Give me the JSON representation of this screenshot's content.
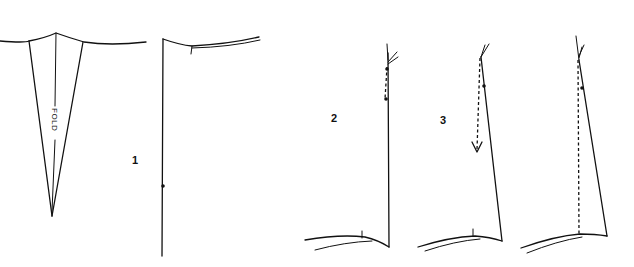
{
  "diagram": {
    "type": "sewing-pattern-steps",
    "background": "#ffffff",
    "ink_color": "#111111",
    "panels": [
      {
        "id": "dart",
        "description": "Fold dart triangle hanging from curved waist seam",
        "fold_label": "FOLD"
      },
      {
        "id": "step-1",
        "step_label": "1",
        "description": "Vertical side/center line with curved waistline at top and a notch dot"
      },
      {
        "id": "step-2",
        "step_label": "2",
        "description": "Vertical line with short dashed segment near top and curved hemline at bottom"
      },
      {
        "id": "step-3",
        "step_label": "3",
        "description": "Slanted line with dashed arrow pointing down from top"
      },
      {
        "id": "step-4",
        "step_label": "",
        "description": "Slanted line with full-length dashed vertical to hemline"
      }
    ]
  }
}
